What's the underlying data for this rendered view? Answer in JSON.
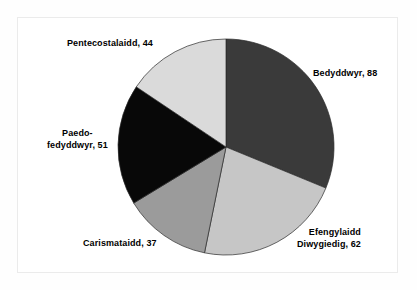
{
  "chart_data": {
    "type": "pie",
    "title": "",
    "categories": [
      "Bedyddwyr",
      "Efengylaidd Diwygiedig",
      "Carismataidd",
      "Paedo-fedyddwyr",
      "Pentecostalaidd"
    ],
    "values": [
      88,
      62,
      37,
      51,
      44
    ],
    "total": 282,
    "start_angle_deg": 0,
    "direction": "clockwise",
    "legend": "none",
    "grid": false,
    "labels": [
      {
        "id": "bedyddwyr",
        "name": "Bedyddwyr",
        "value": 88,
        "text": "Bedyddwyr, 88",
        "lines": [
          "Bedyddwyr, 88"
        ],
        "color": "#3a3a3a",
        "angle_deg": 112.34,
        "percent": 31.2
      },
      {
        "id": "efengylaidd-diwygiedig",
        "name": "Efengylaidd Diwygiedig",
        "value": 62,
        "text": "Efengylaidd Diwygiedig, 62",
        "lines": [
          "Efengylaidd",
          "Diwygiedig, 62"
        ],
        "color": "#c6c6c6",
        "angle_deg": 79.15,
        "percent": 22.0
      },
      {
        "id": "carismataidd",
        "name": "Carismataidd",
        "value": 37,
        "text": "Carismataidd, 37",
        "lines": [
          "Carismataidd, 37"
        ],
        "color": "#9b9b9b",
        "angle_deg": 47.23,
        "percent": 13.1
      },
      {
        "id": "paedo-fedyddwyr",
        "name": "Paedo-fedyddwyr",
        "value": 51,
        "text": "Paedo-fedyddwyr, 51",
        "lines": [
          "Paedo-",
          "fedyddwyr, 51"
        ],
        "color": "#080808",
        "angle_deg": 65.11,
        "percent": 18.1
      },
      {
        "id": "pentecostalaidd",
        "name": "Pentecostalaidd",
        "value": 44,
        "text": "Pentecostalaidd, 44",
        "lines": [
          "Pentecostalaidd, 44"
        ],
        "color": "#dadada",
        "angle_deg": 56.17,
        "percent": 15.6
      }
    ],
    "geometry": {
      "center_x": 226,
      "center_y": 147,
      "radius": 108
    },
    "colors": {
      "background": "#ffffff",
      "frame_border": "#ebebeb",
      "text": "#000000",
      "outline": "#2a2a2a"
    }
  }
}
